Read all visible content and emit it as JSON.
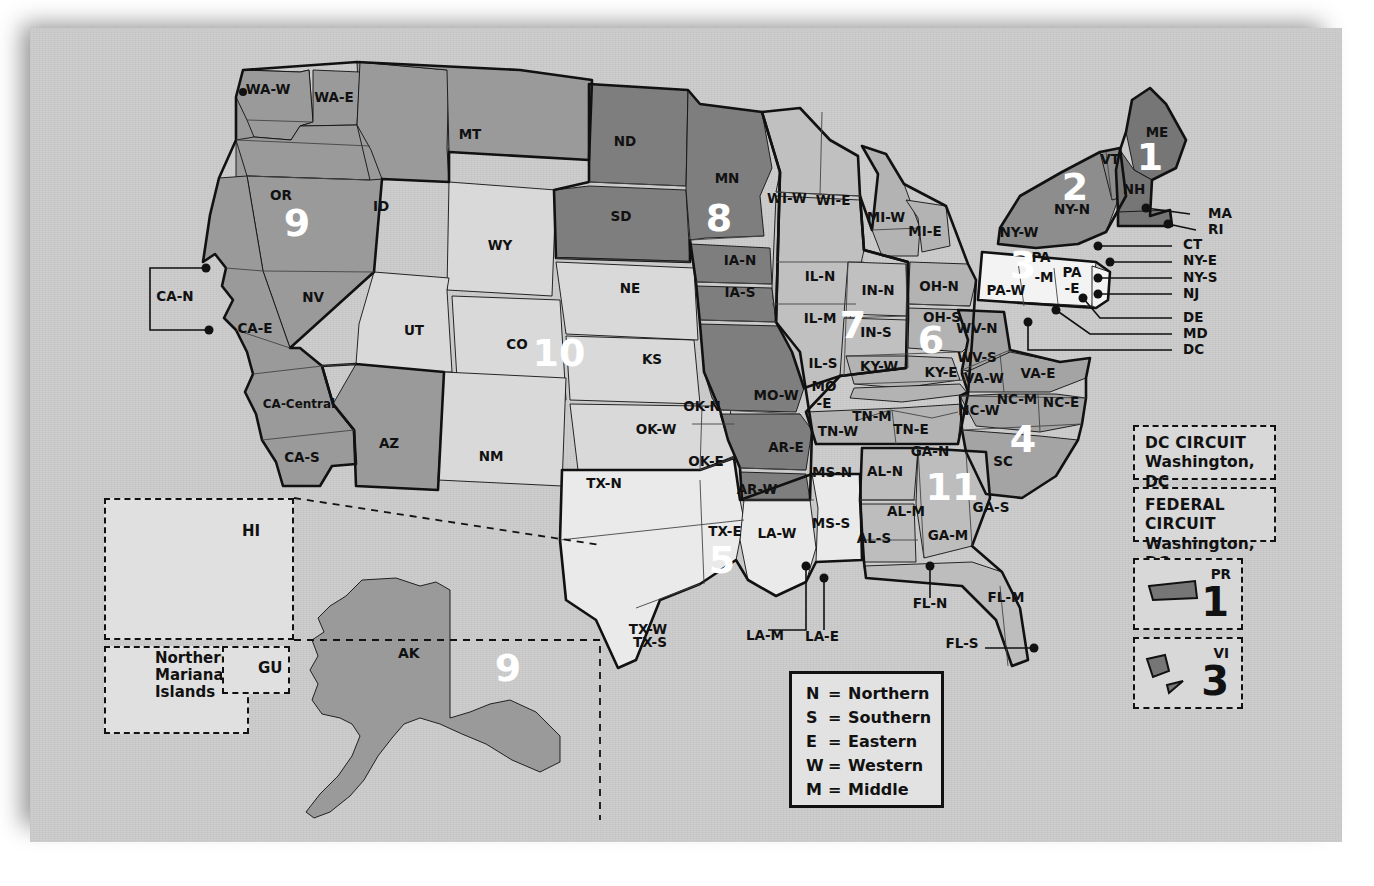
{
  "key_box": {
    "rows": [
      {
        "abbr": "N",
        "eq": "=",
        "word": "Northern"
      },
      {
        "abbr": "S",
        "eq": "=",
        "word": "Southern"
      },
      {
        "abbr": "E",
        "eq": "=",
        "word": "Eastern"
      },
      {
        "abbr": "W",
        "eq": "=",
        "word": "Western"
      },
      {
        "abbr": "M",
        "eq": "=",
        "word": "Middle"
      }
    ]
  },
  "special_circuits": [
    {
      "name": "DC CIRCUIT",
      "location": "Washington, DC"
    },
    {
      "name": "FEDERAL CIRCUIT",
      "location": "Washington, DC"
    }
  ],
  "territories": [
    {
      "abbr": "PR",
      "circuit": "1"
    },
    {
      "abbr": "VI",
      "circuit": "3"
    }
  ],
  "insets": [
    {
      "label": "HI"
    },
    {
      "label": "Northern Mariana Islands"
    },
    {
      "label": "GU"
    },
    {
      "label": "AK"
    }
  ],
  "circuit_numbers": [
    {
      "n": "1",
      "x": 1150,
      "y": 170,
      "color": "#ffffff"
    },
    {
      "n": "2",
      "x": 1075,
      "y": 200,
      "color": "#ffffff"
    },
    {
      "n": "3",
      "x": 1023,
      "y": 278,
      "color": "#ffffff"
    },
    {
      "n": "4",
      "x": 1023,
      "y": 452,
      "color": "#ffffff"
    },
    {
      "n": "5",
      "x": 722,
      "y": 573,
      "color": "#ffffff"
    },
    {
      "n": "6",
      "x": 931,
      "y": 353,
      "color": "#ffffff"
    },
    {
      "n": "7",
      "x": 853,
      "y": 338,
      "color": "#ffffff"
    },
    {
      "n": "8",
      "x": 719,
      "y": 231,
      "color": "#ffffff"
    },
    {
      "n": "9",
      "x": 297,
      "y": 236,
      "color": "#ffffff"
    },
    {
      "n": "9",
      "x": 508,
      "y": 681,
      "color": "#111111"
    },
    {
      "n": "10",
      "x": 559,
      "y": 366,
      "color": "#ffffff"
    },
    {
      "n": "11",
      "x": 952,
      "y": 500,
      "color": "#ffffff"
    }
  ],
  "district_labels": [
    {
      "t": "WA-W",
      "x": 268,
      "y": 94
    },
    {
      "t": "WA-E",
      "x": 334,
      "y": 102
    },
    {
      "t": "OR",
      "x": 281,
      "y": 200
    },
    {
      "t": "ID",
      "x": 381,
      "y": 211
    },
    {
      "t": "MT",
      "x": 470,
      "y": 139
    },
    {
      "t": "ND",
      "x": 625,
      "y": 146
    },
    {
      "t": "SD",
      "x": 621,
      "y": 221
    },
    {
      "t": "MN",
      "x": 727,
      "y": 183
    },
    {
      "t": "WY",
      "x": 500,
      "y": 250
    },
    {
      "t": "NV",
      "x": 313,
      "y": 302
    },
    {
      "t": "CA-N",
      "x": 175,
      "y": 301
    },
    {
      "t": "CA-E",
      "x": 255,
      "y": 333
    },
    {
      "t": "CA-Central",
      "x": 299,
      "y": 408
    },
    {
      "t": "CA-S",
      "x": 302,
      "y": 462
    },
    {
      "t": "UT",
      "x": 414,
      "y": 335
    },
    {
      "t": "CO",
      "x": 517,
      "y": 349
    },
    {
      "t": "NE",
      "x": 630,
      "y": 293
    },
    {
      "t": "KS",
      "x": 652,
      "y": 364
    },
    {
      "t": "AZ",
      "x": 389,
      "y": 448
    },
    {
      "t": "NM",
      "x": 491,
      "y": 461
    },
    {
      "t": "IA-N",
      "x": 740,
      "y": 265
    },
    {
      "t": "IA-S",
      "x": 740,
      "y": 297
    },
    {
      "t": "WI-W",
      "x": 787,
      "y": 203
    },
    {
      "t": "WI-E",
      "x": 833,
      "y": 205
    },
    {
      "t": "MI-W",
      "x": 886,
      "y": 222
    },
    {
      "t": "MI-E",
      "x": 925,
      "y": 236
    },
    {
      "t": "IL-N",
      "x": 820,
      "y": 281
    },
    {
      "t": "IL-M",
      "x": 820,
      "y": 323
    },
    {
      "t": "IL-S",
      "x": 823,
      "y": 368
    },
    {
      "t": "IN-N",
      "x": 878,
      "y": 295
    },
    {
      "t": "IN-S",
      "x": 876,
      "y": 337
    },
    {
      "t": "OH-N",
      "x": 939,
      "y": 291
    },
    {
      "t": "OH-S",
      "x": 942,
      "y": 322
    },
    {
      "t": "PA",
      "x": 1041,
      "y": 262
    },
    {
      "t": "-M",
      "x": 1044,
      "y": 282
    },
    {
      "t": "PA",
      "x": 1072,
      "y": 277
    },
    {
      "t": "-E",
      "x": 1072,
      "y": 293
    },
    {
      "t": "PA-W",
      "x": 1006,
      "y": 295
    },
    {
      "t": "NY-N",
      "x": 1072,
      "y": 214
    },
    {
      "t": "NY-W",
      "x": 1019,
      "y": 237
    },
    {
      "t": "VT",
      "x": 1110,
      "y": 164
    },
    {
      "t": "NH",
      "x": 1134,
      "y": 194
    },
    {
      "t": "ME",
      "x": 1157,
      "y": 137
    },
    {
      "t": "WV-N",
      "x": 977,
      "y": 333
    },
    {
      "t": "WV-S",
      "x": 977,
      "y": 362
    },
    {
      "t": "VA-W",
      "x": 984,
      "y": 383
    },
    {
      "t": "VA-E",
      "x": 1038,
      "y": 378
    },
    {
      "t": "KY-W",
      "x": 879,
      "y": 371
    },
    {
      "t": "KY-E",
      "x": 941,
      "y": 377
    },
    {
      "t": "MO-W",
      "x": 776,
      "y": 400
    },
    {
      "t": "MO",
      "x": 824,
      "y": 391
    },
    {
      "t": "-E",
      "x": 824,
      "y": 408
    },
    {
      "t": "TN-W",
      "x": 838,
      "y": 436
    },
    {
      "t": "TN-M",
      "x": 872,
      "y": 421
    },
    {
      "t": "TN-E",
      "x": 911,
      "y": 434
    },
    {
      "t": "NC-W",
      "x": 979,
      "y": 415
    },
    {
      "t": "NC-M",
      "x": 1017,
      "y": 404
    },
    {
      "t": "NC-E",
      "x": 1061,
      "y": 407
    },
    {
      "t": "SC",
      "x": 1003,
      "y": 466
    },
    {
      "t": "GA-N",
      "x": 930,
      "y": 456
    },
    {
      "t": "GA-M",
      "x": 948,
      "y": 540
    },
    {
      "t": "GA-S",
      "x": 991,
      "y": 512
    },
    {
      "t": "AR-E",
      "x": 786,
      "y": 452
    },
    {
      "t": "AR-W",
      "x": 757,
      "y": 494
    },
    {
      "t": "OK-N",
      "x": 702,
      "y": 411
    },
    {
      "t": "OK-W",
      "x": 656,
      "y": 434
    },
    {
      "t": "OK-E",
      "x": 706,
      "y": 466
    },
    {
      "t": "TX-N",
      "x": 604,
      "y": 488
    },
    {
      "t": "TX-E",
      "x": 725,
      "y": 536
    },
    {
      "t": "TX-W",
      "x": 648,
      "y": 634
    },
    {
      "t": "TX-S",
      "x": 650,
      "y": 647
    },
    {
      "t": "LA-W",
      "x": 777,
      "y": 538
    },
    {
      "t": "LA-M",
      "x": 765,
      "y": 640
    },
    {
      "t": "LA-E",
      "x": 822,
      "y": 641
    },
    {
      "t": "MS-N",
      "x": 832,
      "y": 477
    },
    {
      "t": "MS-S",
      "x": 831,
      "y": 528
    },
    {
      "t": "AL-N",
      "x": 885,
      "y": 476
    },
    {
      "t": "AL-M",
      "x": 906,
      "y": 516
    },
    {
      "t": "AL-S",
      "x": 874,
      "y": 543
    },
    {
      "t": "FL-N",
      "x": 930,
      "y": 608
    },
    {
      "t": "FL-M",
      "x": 1006,
      "y": 602
    },
    {
      "t": "FL-S",
      "x": 962,
      "y": 648
    }
  ],
  "callout_labels": [
    {
      "t": "MA",
      "x": 1208,
      "y": 218
    },
    {
      "t": "RI",
      "x": 1208,
      "y": 234
    },
    {
      "t": "CT",
      "x": 1183,
      "y": 249
    },
    {
      "t": "NY-E",
      "x": 1183,
      "y": 265
    },
    {
      "t": "NY-S",
      "x": 1183,
      "y": 282
    },
    {
      "t": "NJ",
      "x": 1183,
      "y": 298
    },
    {
      "t": "DE",
      "x": 1183,
      "y": 322
    },
    {
      "t": "MD",
      "x": 1183,
      "y": 338
    },
    {
      "t": "DC",
      "x": 1183,
      "y": 354
    }
  ],
  "colors": {
    "background": "#ffffff",
    "card": "#c9c9c9",
    "c1": "#767676",
    "c2": "#8d8d8d",
    "c3": "#f3f3f3",
    "c4": "#a4a4a4",
    "c5": "#eaeaea",
    "c6": "#b3b3b3",
    "c7": "#c0c0c0",
    "c8": "#7e7e7e",
    "c9": "#9a9a9a",
    "c10": "#d9d9d9",
    "c11": "#bdbdbd",
    "outline": "#111111"
  }
}
